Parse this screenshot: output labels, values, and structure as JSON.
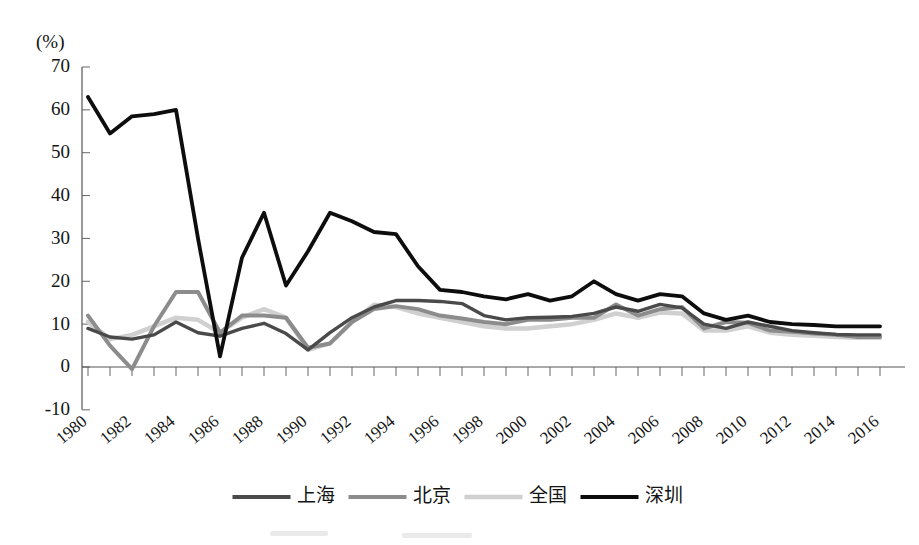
{
  "chart_data": {
    "type": "line",
    "title": "",
    "subtitle": "",
    "xlabel": "",
    "ylabel": "",
    "unit_label": "(%)",
    "grid": false,
    "legend_position": "bottom",
    "ylim": [
      -10,
      70
    ],
    "ytick_step": 10,
    "ytick_labels": [
      "70",
      "60",
      "50",
      "40",
      "30",
      "20",
      "10",
      "0",
      "-10"
    ],
    "ytick_values": [
      70,
      60,
      50,
      40,
      30,
      20,
      10,
      0,
      -10
    ],
    "xlim": [
      1980,
      2016
    ],
    "xtick_label_step": 2,
    "x": [
      1980,
      1981,
      1982,
      1983,
      1984,
      1985,
      1986,
      1987,
      1988,
      1989,
      1990,
      1991,
      1992,
      1993,
      1994,
      1995,
      1996,
      1997,
      1998,
      1999,
      2000,
      2001,
      2002,
      2003,
      2004,
      2005,
      2006,
      2007,
      2008,
      2009,
      2010,
      2011,
      2012,
      2013,
      2014,
      2015,
      2016
    ],
    "xtick_labels": [
      "1980",
      "1982",
      "1984",
      "1986",
      "1988",
      "1990",
      "1992",
      "1994",
      "1996",
      "1998",
      "2000",
      "2002",
      "2004",
      "2006",
      "2008",
      "2010",
      "2012",
      "2014",
      "2016"
    ],
    "series": [
      {
        "name": "上海",
        "color": "#4a4a4a",
        "width": 3.4,
        "values": [
          9.0,
          7.0,
          6.5,
          7.5,
          10.5,
          8.0,
          7.2,
          9.0,
          10.2,
          7.8,
          4.0,
          8.0,
          11.5,
          14.0,
          15.5,
          15.5,
          15.3,
          14.8,
          12.0,
          11.0,
          11.5,
          11.6,
          11.8,
          12.5,
          14.0,
          13.0,
          14.6,
          13.8,
          10.0,
          9.0,
          10.5,
          9.5,
          8.5,
          8.0,
          7.6,
          7.5,
          7.5
        ]
      },
      {
        "name": "北京",
        "color": "#8c8c8c",
        "width": 4.0,
        "values": [
          12.0,
          5.0,
          -0.5,
          9.5,
          17.5,
          17.5,
          8.0,
          12.0,
          12.0,
          11.5,
          4.5,
          5.5,
          10.5,
          13.5,
          14.2,
          13.5,
          12.0,
          11.3,
          10.5,
          10.0,
          11.0,
          11.0,
          11.5,
          11.5,
          14.6,
          12.0,
          13.5,
          14.0,
          9.0,
          10.5,
          10.3,
          8.5,
          8.2,
          7.8,
          7.5,
          7.0,
          7.0
        ]
      },
      {
        "name": "全国",
        "color": "#d0d0d0",
        "width": 4.5,
        "values": [
          10.5,
          6.5,
          7.5,
          9.5,
          11.5,
          11.0,
          8.0,
          11.5,
          13.5,
          11.5,
          4.0,
          5.5,
          10.5,
          14.5,
          14.0,
          12.5,
          11.5,
          10.5,
          9.5,
          9.0,
          9.0,
          9.5,
          10.0,
          11.0,
          12.5,
          11.5,
          12.7,
          12.5,
          8.5,
          8.5,
          9.5,
          8.0,
          7.5,
          7.3,
          7.0,
          6.8,
          6.8
        ]
      },
      {
        "name": "深圳",
        "color": "#0d0d0d",
        "width": 3.8,
        "values": [
          63.0,
          54.5,
          58.5,
          59.0,
          60.0,
          30.0,
          2.5,
          25.5,
          36.0,
          19.0,
          27.0,
          36.0,
          34.0,
          31.5,
          31.0,
          23.5,
          18.0,
          17.5,
          16.5,
          15.8,
          17.0,
          15.5,
          16.5,
          20.0,
          17.0,
          15.5,
          17.0,
          16.5,
          12.5,
          11.0,
          12.0,
          10.5,
          10.0,
          9.8,
          9.5,
          9.5,
          9.5
        ]
      }
    ]
  },
  "legend": {
    "entries": [
      {
        "label": "上海",
        "color": "#4a4a4a"
      },
      {
        "label": "北京",
        "color": "#8c8c8c"
      },
      {
        "label": "全国",
        "color": "#d0d0d0"
      },
      {
        "label": "深圳",
        "color": "#0d0d0d"
      }
    ]
  }
}
